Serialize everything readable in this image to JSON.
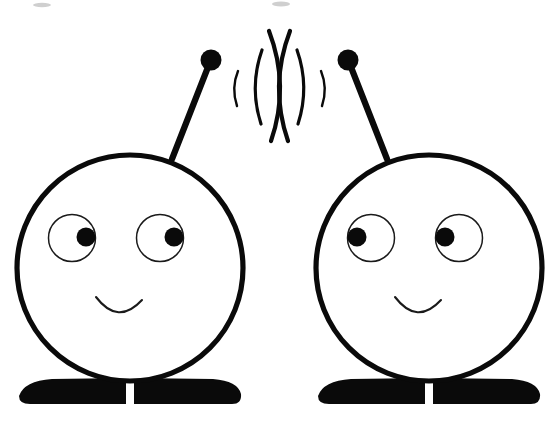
{
  "canvas": {
    "width": 559,
    "height": 443,
    "background_color": "#ffffff",
    "ink_color": "#0a0a0a",
    "title": "Two round-headed characters with antennas exchanging radio waves"
  },
  "scene": {
    "description": "Line drawing of two identical smiling robot/alien characters standing side by side, each with a ball-tipped antenna, transmitting radio wave arcs toward one another.",
    "character_count": 2,
    "wave_group_count": 2
  },
  "characters": [
    {
      "id": "character-left",
      "name": "left-character",
      "head": {
        "cx": 130,
        "cy": 268,
        "r": 113,
        "stroke_width": 5.2,
        "fill_color": "#ffffff",
        "stroke_color": "#0a0a0a"
      },
      "eyes": [
        {
          "id": "eye-left",
          "cx": 72,
          "cy": 238,
          "r": 23.5,
          "pupil_cx": 86,
          "pupil_cy": 237,
          "pupil_r": 9.5
        },
        {
          "id": "eye-right",
          "cx": 160,
          "cy": 238,
          "r": 23.5,
          "pupil_cx": 174,
          "pupil_cy": 237,
          "pupil_r": 9.5
        }
      ],
      "gaze_direction": "right",
      "mouth": {
        "path": "M 96 297 Q 118 326 142 300",
        "stroke_width": 2.1,
        "expression": "smile"
      },
      "antenna": {
        "rod_path": "M 172 159 L 210 62",
        "knob_cx": 211,
        "knob_cy": 60,
        "knob_r": 10.5,
        "rod_stroke_width": 6.2,
        "tilt": "up-right"
      },
      "base": {
        "path": "M 19 396 Q 24 381 52 379 L 126 378 L 126 404 L 30 404 Q 19 404 19 396 Z M 134 378 L 213 379 Q 238 381 241 394 Q 242 404 232 404 L 134 404 Z",
        "gap_center_x": 130,
        "gap_width": 7,
        "fill_color": "#0a0a0a"
      }
    },
    {
      "id": "character-right",
      "name": "right-character",
      "head": {
        "cx": 429,
        "cy": 268,
        "r": 113,
        "stroke_width": 5.2,
        "fill_color": "#ffffff",
        "stroke_color": "#0a0a0a"
      },
      "eyes": [
        {
          "id": "eye-left",
          "cx": 371,
          "cy": 238,
          "r": 23.5,
          "pupil_cx": 357,
          "pupil_cy": 237,
          "pupil_r": 9.5
        },
        {
          "id": "eye-right",
          "cx": 459,
          "cy": 238,
          "r": 23.5,
          "pupil_cx": 445,
          "pupil_cy": 237,
          "pupil_r": 9.5
        }
      ],
      "gaze_direction": "left",
      "mouth": {
        "path": "M 395 297 Q 417 326 441 300",
        "stroke_width": 2.1,
        "expression": "smile"
      },
      "antenna": {
        "rod_path": "M 387 159 L 349 62",
        "knob_cx": 348,
        "knob_cy": 60,
        "knob_r": 10.5,
        "rod_stroke_width": 6.2,
        "tilt": "up-left"
      },
      "base": {
        "path": "M 318 396 Q 323 381 351 379 L 425 378 L 425 404 L 329 404 Q 318 404 318 396 Z M 433 378 L 512 379 Q 537 381 540 394 Q 541 404 531 404 L 433 404 Z",
        "gap_center_x": 429,
        "gap_width": 7,
        "fill_color": "#0a0a0a"
      }
    }
  ],
  "wave_groups": [
    {
      "id": "waves-from-left-antenna",
      "name": "left-signal-waves",
      "origin": "left-antenna-knob",
      "opens_toward": "left",
      "arcs": [
        {
          "index": 1,
          "path": "M 238 71 Q 231 88 237 106",
          "stroke_width": 2.4
        },
        {
          "index": 2,
          "path": "M 262 50 Q 249 87 261 124",
          "stroke_width": 3.2
        },
        {
          "index": 3,
          "path": "M 290 31 Q 269 86 288 141",
          "stroke_width": 4.2
        }
      ]
    },
    {
      "id": "waves-from-right-antenna",
      "name": "right-signal-waves",
      "origin": "right-antenna-knob",
      "opens_toward": "right",
      "arcs": [
        {
          "index": 1,
          "path": "M 321 71 Q 328 88 322 106",
          "stroke_width": 2.4
        },
        {
          "index": 2,
          "path": "M 297 50 Q 310 87 298 124",
          "stroke_width": 3.2
        },
        {
          "index": 3,
          "path": "M 269 31 Q 290 86 271 141",
          "stroke_width": 4.2
        }
      ]
    }
  ],
  "artifacts": [
    {
      "id": "speck-top-center",
      "cx": 281,
      "cy": 4,
      "rx": 9,
      "ry": 2.4,
      "color": "#cfcfcf"
    },
    {
      "id": "speck-top-left",
      "cx": 42,
      "cy": 5,
      "rx": 9,
      "ry": 2.2,
      "color": "#dcdcdc"
    }
  ]
}
